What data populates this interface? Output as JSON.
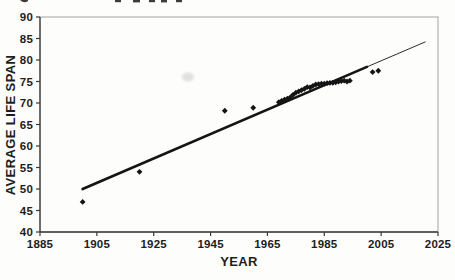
{
  "chart_data": {
    "type": "scatter",
    "title": "",
    "xlabel": "YEAR",
    "ylabel": "AVERAGE LIFE SPAN",
    "xlim": [
      1885,
      2025
    ],
    "ylim": [
      40,
      90
    ],
    "x_ticks": [
      "1885",
      "1905",
      "1925",
      "1945",
      "1965",
      "1985",
      "2005",
      "2025"
    ],
    "y_ticks": [
      "40",
      "45",
      "50",
      "55",
      "60",
      "65",
      "70",
      "75",
      "80",
      "85",
      "90"
    ],
    "grid": false,
    "legend": false,
    "marker": "diamond",
    "series": [
      {
        "name": "average life span (observed)",
        "color": "#141414",
        "points": [
          [
            1900,
            47.0
          ],
          [
            1920,
            54.0
          ],
          [
            1950,
            68.2
          ],
          [
            1960,
            68.9
          ],
          [
            1969,
            70.2
          ],
          [
            1970,
            70.5
          ],
          [
            1971,
            70.8
          ],
          [
            1972,
            71.0
          ],
          [
            1973,
            71.3
          ],
          [
            1974,
            71.9
          ],
          [
            1975,
            72.4
          ],
          [
            1976,
            72.7
          ],
          [
            1977,
            73.0
          ],
          [
            1978,
            73.3
          ],
          [
            1979,
            73.7
          ],
          [
            1980,
            73.6
          ],
          [
            1981,
            74.0
          ],
          [
            1982,
            74.3
          ],
          [
            1983,
            74.4
          ],
          [
            1984,
            74.5
          ],
          [
            1985,
            74.5
          ],
          [
            1986,
            74.6
          ],
          [
            1987,
            74.7
          ],
          [
            1988,
            74.7
          ],
          [
            1989,
            74.8
          ],
          [
            1990,
            75.0
          ],
          [
            1991,
            75.1
          ],
          [
            1992,
            75.2
          ],
          [
            1993,
            75.0
          ],
          [
            1994,
            75.2
          ],
          [
            2002,
            77.2
          ],
          [
            2004,
            77.5
          ]
        ]
      }
    ],
    "trend_line": {
      "color": "#141414",
      "solid_thick_segment": {
        "x": [
          1900,
          2000
        ],
        "y": [
          50.0,
          78.4
        ]
      },
      "thin_extension_segment": {
        "x": [
          2000,
          2020.5
        ],
        "y": [
          78.4,
          84.2
        ]
      }
    },
    "colors": {
      "axis": "#3a3a3a",
      "plot_border": "#9a9a9a",
      "text": "#1e1e1e",
      "background": "#fdfdfc"
    }
  }
}
